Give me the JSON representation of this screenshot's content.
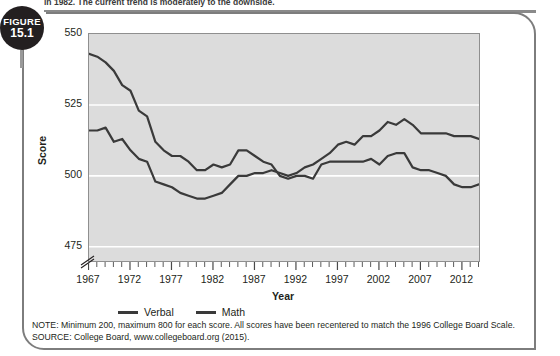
{
  "page": {
    "truncated_body_text": "in 1982. The current trend is moderately to the downside.",
    "figure_label_word": "FIGURE",
    "figure_number": "15.1"
  },
  "notes": {
    "note": "NOTE: Minimum 200, maximum 800 for each score. All scores have been recentered to match the 1996 College Board Scale.",
    "source": "SOURCE: College Board, www.collegeboard.org (2015)."
  },
  "colors": {
    "plot_background": "#dcdcdc",
    "gridline": "#ffffff",
    "line_verbal": "#3a3a3a",
    "line_math": "#3a3a3a",
    "frame": "#7d7d7d",
    "text": "#231f20"
  },
  "chart_data": {
    "type": "line",
    "title": "",
    "xlabel": "Year",
    "ylabel": "Score",
    "ylim": [
      470,
      550
    ],
    "xlim": [
      1967,
      2014
    ],
    "grid": true,
    "grid_values": [
      550,
      525,
      500,
      475
    ],
    "y_ticks": [
      "550",
      "525",
      "500",
      "475"
    ],
    "y_tick_values": [
      550,
      525,
      500,
      475
    ],
    "axis_break": true,
    "legend_position": "below-left",
    "x_tick_labels": [
      "1967",
      "1972",
      "1977",
      "1982",
      "1987",
      "1992",
      "1997",
      "2002",
      "2007",
      "2012"
    ],
    "x_tick_label_values": [
      1967,
      1972,
      1977,
      1982,
      1987,
      1992,
      1997,
      2002,
      2007,
      2012
    ],
    "x": [
      1967,
      1968,
      1969,
      1970,
      1971,
      1972,
      1973,
      1974,
      1975,
      1976,
      1977,
      1978,
      1979,
      1980,
      1981,
      1982,
      1983,
      1984,
      1985,
      1986,
      1987,
      1988,
      1989,
      1990,
      1991,
      1992,
      1993,
      1994,
      1995,
      1996,
      1997,
      1998,
      1999,
      2000,
      2001,
      2002,
      2003,
      2004,
      2005,
      2006,
      2007,
      2008,
      2009,
      2010,
      2011,
      2012,
      2013,
      2014
    ],
    "series": [
      {
        "name": "Verbal",
        "values": [
          543,
          542,
          540,
          537,
          532,
          530,
          523,
          521,
          512,
          509,
          507,
          507,
          505,
          502,
          502,
          504,
          503,
          504,
          509,
          509,
          507,
          505,
          504,
          500,
          499,
          500,
          500,
          499,
          504,
          505,
          505,
          505,
          505,
          505,
          506,
          504,
          507,
          508,
          508,
          503,
          502,
          502,
          501,
          500,
          497,
          496,
          496,
          497
        ]
      },
      {
        "name": "Math",
        "values": [
          516,
          516,
          517,
          512,
          513,
          509,
          506,
          505,
          498,
          497,
          496,
          494,
          493,
          492,
          492,
          493,
          494,
          497,
          500,
          500,
          501,
          501,
          502,
          501,
          500,
          501,
          503,
          504,
          506,
          508,
          511,
          512,
          511,
          514,
          514,
          516,
          519,
          518,
          520,
          518,
          515,
          515,
          515,
          515,
          514,
          514,
          514,
          513
        ]
      }
    ],
    "legend": [
      "Verbal",
      "Math"
    ],
    "annotations": []
  }
}
